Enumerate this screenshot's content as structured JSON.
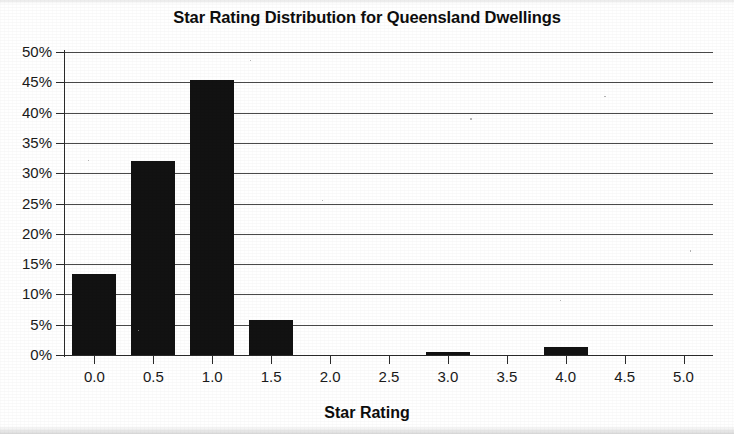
{
  "chart_data": {
    "type": "bar",
    "title": "Star Rating Distribution for Queensland Dwellings",
    "xlabel": "Star Rating",
    "ylabel": "",
    "categories": [
      "0.0",
      "0.5",
      "1.0",
      "1.5",
      "2.0",
      "2.5",
      "3.0",
      "3.5",
      "4.0",
      "4.5",
      "5.0"
    ],
    "values": [
      13.4,
      32.0,
      45.3,
      5.7,
      0.0,
      0.0,
      0.5,
      0.0,
      1.3,
      0.0,
      0.0
    ],
    "value_labels": [
      "13.4%",
      "32.0%",
      "45.3%",
      "5.7%",
      "0%",
      "0%",
      "0.5%",
      "0%",
      "1.3%",
      "0%",
      "0%"
    ],
    "ylim": [
      0,
      50
    ],
    "xlim": [
      -0.25,
      5.25
    ],
    "y_tick_labels": [
      "0%",
      "5%",
      "10%",
      "15%",
      "20%",
      "25%",
      "30%",
      "35%",
      "40%",
      "45%",
      "50%"
    ],
    "y_tick_values": [
      0,
      5,
      10,
      15,
      20,
      25,
      30,
      35,
      40,
      45,
      50
    ],
    "x_tick_labels": [
      "0.0",
      "0.5",
      "1.0",
      "1.5",
      "2.0",
      "2.5",
      "3.0",
      "3.5",
      "4.0",
      "4.5",
      "5.0"
    ],
    "x_tick_values": [
      0.0,
      0.5,
      1.0,
      1.5,
      2.0,
      2.5,
      3.0,
      3.5,
      4.0,
      4.5,
      5.0
    ],
    "grid": "horizontal",
    "legend": null,
    "legend_position": "none",
    "bar_color": "#121212",
    "grid_color": "#4a4a4a",
    "axis_color": "#2b2b2b",
    "background_color": "#ffffff"
  }
}
